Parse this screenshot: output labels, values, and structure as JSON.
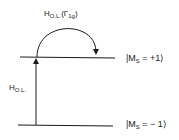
{
  "diagram": {
    "type": "energy-level-diagram",
    "levels": [
      {
        "id": "upper",
        "label_prefix": "|M",
        "label_sub": "S",
        "label_suffix": " = +1⟩"
      },
      {
        "id": "lower",
        "label_prefix": "|M",
        "label_sub": "S",
        "label_suffix": " = − 1⟩"
      }
    ],
    "transitions": [
      {
        "id": "vertical",
        "from": "lower",
        "to": "upper",
        "label_main": "H",
        "label_sub": "O.L."
      },
      {
        "id": "arc",
        "from": "upper",
        "to": "upper",
        "label_main": "H",
        "label_sub": "O.L.",
        "label_suffix": "(Γ",
        "label_suffix_sub": "1g",
        "label_close": ")"
      }
    ],
    "colors": {
      "line": "#1a1a1a",
      "background": "#ffffff"
    }
  }
}
